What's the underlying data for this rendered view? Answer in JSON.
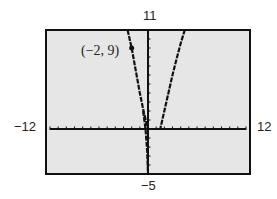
{
  "chart_data": {
    "type": "line",
    "title": "",
    "xlabel": "",
    "ylabel": "",
    "xlim": [
      -12,
      12
    ],
    "ylim": [
      -5,
      11
    ],
    "grid": false,
    "window_labels": {
      "xmin": "−12",
      "xmax": "12",
      "ymax": "11",
      "ymin": "−5"
    },
    "x_tick_step": 1,
    "y_tick_step": 1,
    "series": [
      {
        "name": "graph",
        "x": [
          -2.5,
          -2.0,
          -1.5,
          -1.0,
          -0.5,
          0,
          0.5,
          1.0,
          1.5,
          2.0,
          2.5,
          3.0,
          3.5,
          4.0,
          4.5
        ],
        "y": [
          11,
          9,
          6.5,
          4,
          1.8,
          0,
          0,
          0,
          0,
          2,
          4,
          6,
          7.8,
          9.5,
          11
        ]
      },
      {
        "name": "vertical-branch",
        "x": [
          -0.6,
          -0.3,
          -0.1,
          0
        ],
        "y": [
          2,
          0,
          -2.5,
          -5
        ]
      }
    ],
    "annotations": [
      {
        "text": "(−2, 9)",
        "x": -2,
        "y": 9,
        "marker": "dot"
      }
    ],
    "colors": {
      "background": "#e6e6e6",
      "frame": "#111111",
      "curve": "#111111"
    }
  }
}
